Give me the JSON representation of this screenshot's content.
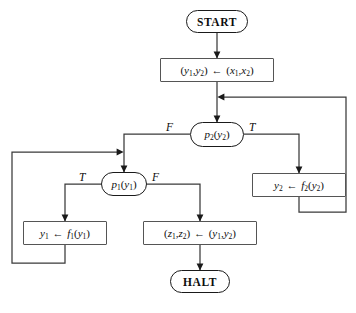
{
  "diagram": {
    "canvas": {
      "width": 356,
      "height": 313
    },
    "ink_color": "#1a1a1a",
    "box_border_color": "#555555",
    "background": "#ffffff"
  },
  "nodes": {
    "start": {
      "label": "START",
      "shape": "terminal"
    },
    "init": {
      "label": "(y1,y2) ← (x1,x2)",
      "shape": "process"
    },
    "test2": {
      "label": "p2(y2)",
      "shape": "decision"
    },
    "test1": {
      "label": "p1(y1)",
      "shape": "decision"
    },
    "update2": {
      "label": "y2 ← f2(y2)",
      "shape": "process"
    },
    "update1": {
      "label": "y1 ← f1(y1)",
      "shape": "process"
    },
    "output": {
      "label": "(z1,z2) ← (y1,y2)",
      "shape": "process"
    },
    "halt": {
      "label": "HALT",
      "shape": "terminal"
    }
  },
  "branch_labels": {
    "test2_false": "F",
    "test2_true": "T",
    "test1_true": "T",
    "test1_false": "F"
  },
  "edges": [
    {
      "from": "start",
      "to": "init",
      "label": ""
    },
    {
      "from": "init",
      "to": "test2",
      "label": ""
    },
    {
      "from": "test2",
      "to": "test1",
      "label": "F"
    },
    {
      "from": "test2",
      "to": "update2",
      "label": "T"
    },
    {
      "from": "update2",
      "to": "test2",
      "label": ""
    },
    {
      "from": "test1",
      "to": "update1",
      "label": "T"
    },
    {
      "from": "test1",
      "to": "output",
      "label": "F"
    },
    {
      "from": "update1",
      "to": "test1",
      "label": ""
    },
    {
      "from": "output",
      "to": "halt",
      "label": ""
    }
  ]
}
